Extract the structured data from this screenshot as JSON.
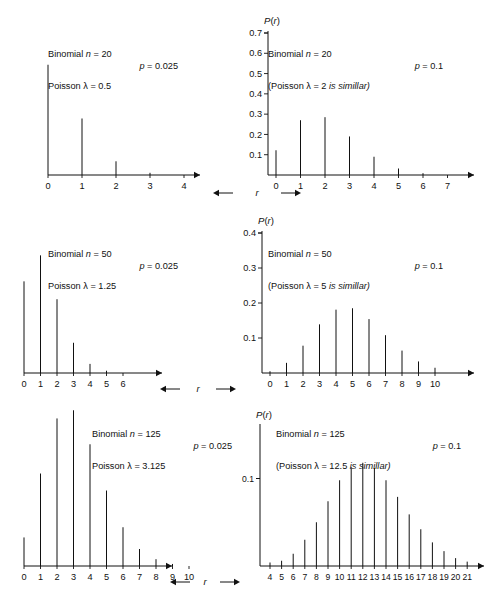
{
  "figure": {
    "axis_variable_label": "r",
    "axis_value_label": "P(r)",
    "panels": [
      {
        "id": "top-left",
        "annotation": {
          "line1": "Binomial n = 20",
          "line2": "p = 0.025",
          "line3": "Poisson λ = 0.5"
        },
        "ylabel": "P(r)",
        "xlabel": "r"
      },
      {
        "id": "top-right",
        "annotation": {
          "line1": "Binomial n = 20",
          "line2": "p = 0.1",
          "line3": "(Poisson λ = 2 is simillar)"
        },
        "ylabel": "P(r)",
        "xlabel": "r"
      },
      {
        "id": "middle-left",
        "annotation": {
          "line1": "Binomial n = 50",
          "line2": "p = 0.025",
          "line3": "Poisson λ = 1.25"
        },
        "ylabel": "P(r)",
        "xlabel": "r"
      },
      {
        "id": "middle-right",
        "annotation": {
          "line1": "Binomial n = 50",
          "line2": "p = 0.1",
          "line3": "(Poisson λ = 5 is simillar)"
        },
        "ylabel": "P(r)",
        "xlabel": "r"
      },
      {
        "id": "bottom-left",
        "annotation": {
          "line1": "Binomial n = 125",
          "line2": "p = 0.025",
          "line3": "Poisson λ = 3.125"
        },
        "ylabel": "P(r)",
        "xlabel": "r"
      },
      {
        "id": "bottom-right",
        "annotation": {
          "line1": "Binomial n = 125",
          "line2": "p = 0.1",
          "line3": "(Poisson λ = 12.5 is simillar)"
        },
        "ylabel": "P(r)",
        "xlabel": "r"
      }
    ]
  },
  "chart_data": [
    {
      "id": "top-left",
      "type": "bar",
      "title": "Binomial n = 20, p = 0.025 (Poisson λ = 0.5)",
      "xlabel": "r",
      "ylabel": "P(r)",
      "categories": [
        "0",
        "1",
        "2",
        "3",
        "4"
      ],
      "values": [
        0.603,
        0.309,
        0.075,
        0.012,
        0.001
      ],
      "ylim": [
        0,
        0.7
      ],
      "yticks": [
        0.1,
        0.2,
        0.3,
        0.4,
        0.5,
        0.6,
        0.7
      ],
      "ytick_labels": [
        "0.1",
        "0.2",
        "0.3",
        "0.4",
        "0.5",
        "0.6",
        "0.7"
      ],
      "grid": false,
      "legend": "none",
      "yaxis_side": "right"
    },
    {
      "id": "top-right",
      "type": "bar",
      "title": "Binomial n = 20, p = 0.1 (Poisson λ = 2 is simillar)",
      "xlabel": "r",
      "ylabel": "P(r)",
      "categories": [
        "0",
        "1",
        "2",
        "3",
        "4",
        "5",
        "6",
        "7"
      ],
      "values": [
        0.122,
        0.27,
        0.285,
        0.19,
        0.09,
        0.032,
        0.009,
        0.002
      ],
      "ylim": [
        0,
        0.7
      ],
      "yticks": [
        0.1,
        0.2,
        0.3,
        0.4,
        0.5,
        0.6,
        0.7
      ],
      "ytick_labels": [
        "0.1",
        "0.2",
        "0.3",
        "0.4",
        "0.5",
        "0.6",
        "0.7"
      ],
      "grid": false,
      "legend": "none",
      "yaxis_side": "left"
    },
    {
      "id": "middle-left",
      "type": "bar",
      "title": "Binomial n = 50, p = 0.025 (Poisson λ = 1.25)",
      "xlabel": "r",
      "ylabel": "P(r)",
      "categories": [
        "0",
        "1",
        "2",
        "3",
        "4",
        "5",
        "6"
      ],
      "values": [
        0.282,
        0.362,
        0.227,
        0.093,
        0.028,
        0.007,
        0.001
      ],
      "ylim": [
        0,
        0.4
      ],
      "yticks": [
        0.1,
        0.2,
        0.3,
        0.4
      ],
      "ytick_labels": [
        "0.1",
        "0.2",
        "0.3",
        "0.4"
      ],
      "grid": false,
      "legend": "none",
      "yaxis_side": "right"
    },
    {
      "id": "middle-right",
      "type": "bar",
      "title": "Binomial n = 50, p = 0.1 (Poisson λ = 5 is simillar)",
      "xlabel": "r",
      "ylabel": "P(r)",
      "categories": [
        "0",
        "1",
        "2",
        "3",
        "4",
        "5",
        "6",
        "7",
        "8",
        "9",
        "10"
      ],
      "values": [
        0.005,
        0.029,
        0.078,
        0.139,
        0.181,
        0.185,
        0.154,
        0.108,
        0.064,
        0.033,
        0.015
      ],
      "ylim": [
        0,
        0.4
      ],
      "yticks": [
        0.1,
        0.2,
        0.3,
        0.4
      ],
      "ytick_labels": [
        "0.1",
        "0.2",
        "0.3",
        "0.4"
      ],
      "grid": false,
      "legend": "none",
      "yaxis_side": "left"
    },
    {
      "id": "bottom-left",
      "type": "bar",
      "title": "Binomial n = 125, p = 0.025 (Poisson λ = 3.125)",
      "xlabel": "r",
      "ylabel": "P(r)",
      "categories": [
        "0",
        "1",
        "2",
        "3",
        "4",
        "5",
        "6",
        "7",
        "8",
        "9",
        "10"
      ],
      "values": [
        0.042,
        0.136,
        0.217,
        0.229,
        0.179,
        0.111,
        0.057,
        0.025,
        0.01,
        0.003,
        0.001
      ],
      "ylim": [
        0,
        0.2
      ],
      "yticks": [
        0.1,
        0.2
      ],
      "ytick_labels": [
        "0.1",
        "0.2"
      ],
      "grid": false,
      "legend": "none",
      "yaxis_side": "right"
    },
    {
      "id": "bottom-right",
      "type": "bar",
      "title": "Binomial n = 125, p = 0.1 (Poisson λ = 12.5 is simillar)",
      "xlabel": "r",
      "ylabel": "P(r)",
      "categories": [
        "4",
        "5",
        "6",
        "7",
        "8",
        "9",
        "10",
        "11",
        "12",
        "13",
        "14",
        "15",
        "16",
        "17",
        "18",
        "19",
        "20",
        "21"
      ],
      "values": [
        0.004,
        0.006,
        0.014,
        0.03,
        0.05,
        0.074,
        0.098,
        0.113,
        0.118,
        0.112,
        0.098,
        0.079,
        0.059,
        0.042,
        0.027,
        0.017,
        0.009,
        0.005
      ],
      "ylim": [
        0,
        0.16
      ],
      "yticks": [
        0.1
      ],
      "ytick_labels": [
        "0.1"
      ],
      "grid": false,
      "legend": "none",
      "yaxis_side": "left"
    }
  ]
}
